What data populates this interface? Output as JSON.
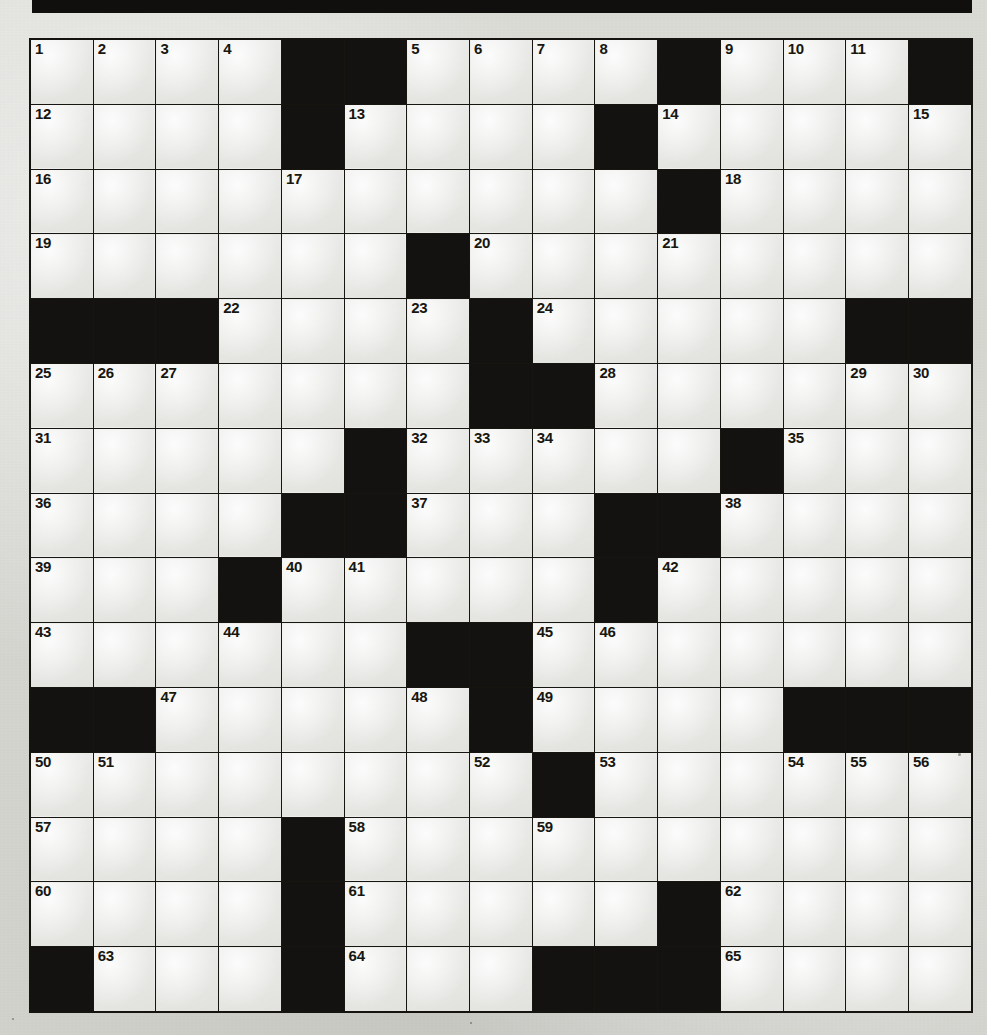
{
  "page": {
    "kind": "crossword-puzzle-grid",
    "title": "",
    "background_color": "#d9d9d4",
    "paper_color": "#e6e6e3",
    "block_color": "#131210",
    "line_color": "#16150f",
    "number_color": "#17160f"
  },
  "top_bar": {
    "color": "#100f0d",
    "label": ""
  },
  "grid": {
    "columns": 15,
    "rows": 15,
    "cell_width_px": 61.73,
    "cell_height_px": 63.8,
    "legend": {
      "W": "white letter cell",
      "B": "black block cell"
    },
    "layout": [
      [
        "W",
        "W",
        "W",
        "W",
        "B",
        "B",
        "W",
        "W",
        "W",
        "W",
        "B",
        "W",
        "W",
        "W",
        "B"
      ],
      [
        "W",
        "W",
        "W",
        "W",
        "B",
        "W",
        "W",
        "W",
        "W",
        "B",
        "W",
        "W",
        "W",
        "W",
        "W"
      ],
      [
        "W",
        "W",
        "W",
        "W",
        "W",
        "W",
        "W",
        "W",
        "W",
        "W",
        "B",
        "W",
        "W",
        "W",
        "W"
      ],
      [
        "W",
        "W",
        "W",
        "W",
        "W",
        "W",
        "B",
        "W",
        "W",
        "W",
        "W",
        "W",
        "W",
        "W",
        "W"
      ],
      [
        "B",
        "B",
        "B",
        "W",
        "W",
        "W",
        "W",
        "B",
        "W",
        "W",
        "W",
        "W",
        "W",
        "B",
        "B"
      ],
      [
        "W",
        "W",
        "W",
        "W",
        "W",
        "W",
        "W",
        "B",
        "B",
        "W",
        "W",
        "W",
        "W",
        "W",
        "W"
      ],
      [
        "W",
        "W",
        "W",
        "W",
        "W",
        "B",
        "W",
        "W",
        "W",
        "W",
        "W",
        "B",
        "W",
        "W",
        "W"
      ],
      [
        "W",
        "W",
        "W",
        "W",
        "B",
        "B",
        "W",
        "W",
        "W",
        "B",
        "B",
        "W",
        "W",
        "W",
        "W"
      ],
      [
        "W",
        "W",
        "W",
        "B",
        "W",
        "W",
        "W",
        "W",
        "W",
        "B",
        "W",
        "W",
        "W",
        "W",
        "W"
      ],
      [
        "W",
        "W",
        "W",
        "W",
        "W",
        "W",
        "B",
        "B",
        "W",
        "W",
        "W",
        "W",
        "W",
        "W",
        "W"
      ],
      [
        "B",
        "B",
        "W",
        "W",
        "W",
        "W",
        "W",
        "B",
        "W",
        "W",
        "W",
        "W",
        "B",
        "B",
        "B"
      ],
      [
        "W",
        "W",
        "W",
        "W",
        "W",
        "W",
        "W",
        "W",
        "B",
        "W",
        "W",
        "W",
        "W",
        "W",
        "W"
      ],
      [
        "W",
        "W",
        "W",
        "W",
        "B",
        "W",
        "W",
        "W",
        "W",
        "W",
        "W",
        "W",
        "W",
        "W",
        "W"
      ],
      [
        "W",
        "W",
        "W",
        "W",
        "B",
        "W",
        "W",
        "W",
        "W",
        "W",
        "B",
        "W",
        "W",
        "W",
        "W"
      ],
      [
        "B",
        "W",
        "W",
        "W",
        "B",
        "W",
        "W",
        "W",
        "B",
        "B",
        "B",
        "W",
        "W",
        "W",
        "W"
      ]
    ],
    "numbers": [
      [
        "1",
        "2",
        "3",
        "4",
        "",
        "",
        "5",
        "6",
        "7",
        "8",
        "",
        "9",
        "10",
        "11",
        ""
      ],
      [
        "12",
        "",
        "",
        "",
        "",
        "13",
        "",
        "",
        "",
        "",
        "14",
        "",
        "",
        "",
        "15"
      ],
      [
        "16",
        "",
        "",
        "",
        "17",
        "",
        "",
        "",
        "",
        "",
        "",
        "18",
        "",
        "",
        ""
      ],
      [
        "19",
        "",
        "",
        "",
        "",
        "",
        "",
        "20",
        "",
        "",
        "21",
        "",
        "",
        "",
        ""
      ],
      [
        "",
        "",
        "",
        "22",
        "",
        "",
        "23",
        "",
        "24",
        "",
        "",
        "",
        "",
        "",
        ""
      ],
      [
        "25",
        "26",
        "27",
        "",
        "",
        "",
        "",
        "",
        "",
        "28",
        "",
        "",
        "",
        "29",
        "30"
      ],
      [
        "31",
        "",
        "",
        "",
        "",
        "",
        "32",
        "33",
        "34",
        "",
        "",
        "",
        "35",
        "",
        ""
      ],
      [
        "36",
        "",
        "",
        "",
        "",
        "",
        "37",
        "",
        "",
        "",
        "",
        "38",
        "",
        "",
        ""
      ],
      [
        "39",
        "",
        "",
        "",
        "40",
        "41",
        "",
        "",
        "",
        "",
        "42",
        "",
        "",
        "",
        ""
      ],
      [
        "43",
        "",
        "",
        "44",
        "",
        "",
        "",
        "",
        "45",
        "46",
        "",
        "",
        "",
        "",
        ""
      ],
      [
        "",
        "",
        "47",
        "",
        "",
        "",
        "48",
        "",
        "49",
        "",
        "",
        "",
        "",
        "",
        ""
      ],
      [
        "50",
        "51",
        "",
        "",
        "",
        "",
        "",
        "52",
        "",
        "53",
        "",
        "",
        "54",
        "55",
        "56"
      ],
      [
        "57",
        "",
        "",
        "",
        "",
        "58",
        "",
        "",
        "59",
        "",
        "",
        "",
        "",
        "",
        ""
      ],
      [
        "60",
        "",
        "",
        "",
        "",
        "61",
        "",
        "",
        "",
        "",
        "",
        "62",
        "",
        "",
        ""
      ],
      [
        "",
        "63",
        "",
        "",
        "",
        "64",
        "",
        "",
        "",
        "",
        "",
        "65",
        "",
        "",
        ""
      ]
    ],
    "clue_numbers_present": [
      1,
      2,
      3,
      4,
      5,
      6,
      7,
      8,
      9,
      10,
      11,
      12,
      13,
      14,
      15,
      16,
      17,
      18,
      19,
      20,
      21,
      22,
      23,
      24,
      25,
      26,
      27,
      28,
      29,
      30,
      31,
      32,
      33,
      34,
      35,
      36,
      37,
      38,
      39,
      40,
      41,
      42,
      43,
      44,
      45,
      46,
      47,
      48,
      49,
      50,
      51,
      52,
      53,
      54,
      55,
      56,
      57,
      58,
      59,
      60,
      61,
      62,
      63,
      64,
      65
    ],
    "highest_number": 65
  }
}
